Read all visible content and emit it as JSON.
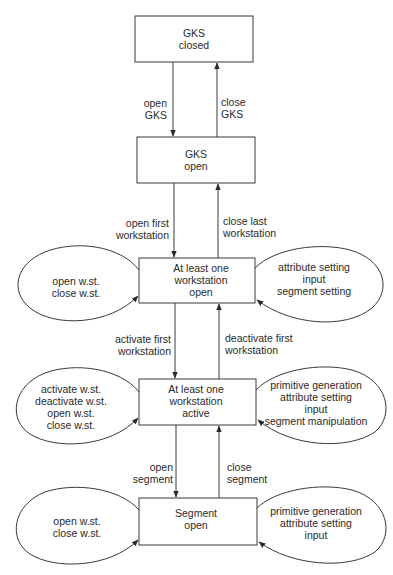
{
  "states": [
    {
      "id": "gks_closed",
      "lines": [
        "GKS",
        "closed"
      ]
    },
    {
      "id": "gks_open",
      "lines": [
        "GKS",
        "open"
      ]
    },
    {
      "id": "ws_open",
      "lines": [
        "At least one",
        "workstation",
        "open"
      ]
    },
    {
      "id": "ws_active",
      "lines": [
        "At least one",
        "workstation",
        "active"
      ]
    },
    {
      "id": "segment_open",
      "lines": [
        "Segment",
        "open"
      ]
    }
  ],
  "transitions": [
    {
      "from": "gks_closed",
      "to": "gks_open",
      "lines": [
        "open",
        "GKS"
      ]
    },
    {
      "from": "gks_open",
      "to": "gks_closed",
      "lines": [
        "close",
        "GKS"
      ]
    },
    {
      "from": "gks_open",
      "to": "ws_open",
      "lines": [
        "open first",
        "workstation"
      ]
    },
    {
      "from": "ws_open",
      "to": "gks_open",
      "lines": [
        "close last",
        "workstation"
      ]
    },
    {
      "from": "ws_open",
      "to": "ws_active",
      "lines": [
        "activate first",
        "workstation"
      ]
    },
    {
      "from": "ws_active",
      "to": "ws_open",
      "lines": [
        "deactivate first",
        "workstation"
      ]
    },
    {
      "from": "ws_active",
      "to": "segment_open",
      "lines": [
        "open",
        "segment"
      ]
    },
    {
      "from": "segment_open",
      "to": "ws_active",
      "lines": [
        "close",
        "segment"
      ]
    }
  ],
  "self_loops": {
    "ws_open": {
      "left": [
        "open w.st.",
        "close w.st."
      ],
      "right": [
        "attribute setting",
        "input",
        "segment setting"
      ]
    },
    "ws_active": {
      "left": [
        "activate w.st.",
        "deactivate w.st.",
        "open w.st.",
        "close w.st."
      ],
      "right": [
        "primitive generation",
        "attribute setting",
        "input",
        "segment manipulation"
      ]
    },
    "segment_open": {
      "left": [
        "open w.st.",
        "close w.st."
      ],
      "right": [
        "primitive generation",
        "attribute setting",
        "input"
      ]
    }
  },
  "colors": {
    "stroke": "#3a3a3a",
    "text": "#2a2a2a",
    "background": "#ffffff"
  }
}
